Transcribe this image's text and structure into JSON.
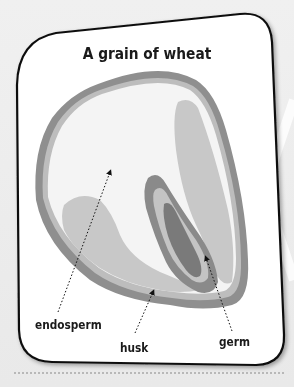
{
  "diagram": {
    "title": "A grain of wheat",
    "labels": {
      "endosperm": "endosperm",
      "husk": "husk",
      "germ": "germ"
    },
    "colors": {
      "card_fill": "#ffffff",
      "card_border": "#111111",
      "husk_outer": "#8f8f8f",
      "husk_inner": "#bdbdbd",
      "endosperm": "#f4f4f4",
      "aleurone_lobes": "#c8c8c8",
      "germ_outer": "#8a8a8a",
      "germ_mid": "#c4c4c4",
      "germ_core": "#7a7a7a",
      "background": "#ececec"
    },
    "parts": [
      {
        "name": "endosperm",
        "pointer": "dotted arrow from label to the inner white region"
      },
      {
        "name": "husk",
        "pointer": "dotted arrow from label to outer grey rim"
      },
      {
        "name": "germ",
        "pointer": "dotted arrow from label to dark inner core"
      }
    ]
  }
}
